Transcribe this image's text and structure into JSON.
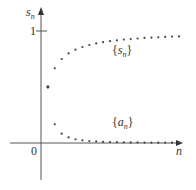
{
  "chart_data": {
    "type": "scatter",
    "title": "",
    "xlabel": "n",
    "ylabel": "s_n",
    "ytick_labels": [
      "1"
    ],
    "origin_label": "0",
    "ylim": [
      -0.2,
      1.2
    ],
    "series": [
      {
        "name": "{s_n}",
        "label": "{s",
        "label_sub": "n",
        "label_close": "}",
        "x": [
          1,
          2,
          3,
          4,
          5,
          6,
          7,
          8,
          9,
          10,
          11,
          12,
          13,
          14,
          15,
          16,
          17,
          18,
          19,
          20
        ],
        "values": [
          0.5,
          0.667,
          0.75,
          0.8,
          0.833,
          0.857,
          0.875,
          0.889,
          0.9,
          0.909,
          0.917,
          0.923,
          0.929,
          0.933,
          0.938,
          0.941,
          0.944,
          0.947,
          0.95,
          0.952
        ]
      },
      {
        "name": "{a_n}",
        "label": "{a",
        "label_sub": "n",
        "label_close": "}",
        "x": [
          1,
          2,
          3,
          4,
          5,
          6,
          7,
          8,
          9,
          10,
          11,
          12,
          13,
          14,
          15,
          16,
          17,
          18,
          19,
          20
        ],
        "values": [
          0.5,
          0.167,
          0.083,
          0.05,
          0.033,
          0.024,
          0.018,
          0.014,
          0.011,
          0.009,
          0.008,
          0.006,
          0.005,
          0.005,
          0.004,
          0.004,
          0.003,
          0.003,
          0.003,
          0.002
        ]
      }
    ],
    "grid": false,
    "legend": "inline labels"
  }
}
